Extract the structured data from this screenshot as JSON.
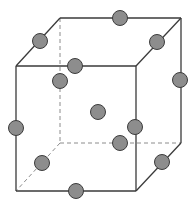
{
  "diagram": {
    "title": "",
    "colors": {
      "edge": "#3a3a3a",
      "hidden_edge": "#8c8c8c",
      "atom_fill": "#8d8d8d",
      "atom_stroke": "#3c3c3c",
      "background": "#ffffff"
    },
    "vertices": {
      "front_top_left": [
        16,
        66
      ],
      "front_top_right": [
        136,
        66
      ],
      "front_bottom_right": [
        136,
        191
      ],
      "front_bottom_left": [
        16,
        191
      ],
      "back_top_left": [
        60,
        18
      ],
      "back_top_right": [
        181,
        18
      ],
      "back_bottom_right": [
        181,
        143
      ],
      "back_bottom_left": [
        60,
        143
      ]
    },
    "atoms": [
      {
        "name": "back-top-edge",
        "x": 120,
        "y": 18
      },
      {
        "name": "top-left-depth-edge",
        "x": 40,
        "y": 41
      },
      {
        "name": "top-right-depth-edge",
        "x": 157,
        "y": 42
      },
      {
        "name": "front-top-edge",
        "x": 75,
        "y": 66
      },
      {
        "name": "back-left-vertical-edge",
        "x": 60,
        "y": 81
      },
      {
        "name": "back-right-vertical-edge",
        "x": 180,
        "y": 80
      },
      {
        "name": "body-center",
        "x": 98,
        "y": 112
      },
      {
        "name": "front-left-vertical-edge",
        "x": 16,
        "y": 128
      },
      {
        "name": "front-right-vertical-edge",
        "x": 135,
        "y": 127
      },
      {
        "name": "back-bottom-edge",
        "x": 120,
        "y": 143
      },
      {
        "name": "bottom-left-depth-edge",
        "x": 42,
        "y": 163
      },
      {
        "name": "bottom-right-depth-edge",
        "x": 162,
        "y": 162
      },
      {
        "name": "front-bottom-edge",
        "x": 76,
        "y": 191
      }
    ],
    "atom_radius": 7.5
  }
}
